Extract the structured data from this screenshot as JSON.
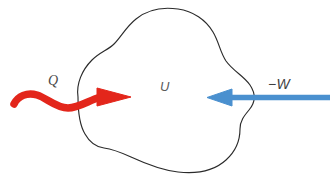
{
  "figure": {
    "background_color": "#ffffff"
  },
  "system": {
    "name": "system-boundary-blob",
    "outline_color": "#2b2b2b",
    "fill_color": "#ffffff",
    "internal_energy_label": "U"
  },
  "flows": [
    {
      "id": "heat-in",
      "label": "Q",
      "color": "#e3261b",
      "direction": "into-system",
      "style": "wavy",
      "meaning": "heat added to system"
    },
    {
      "id": "work-in",
      "label": "−W",
      "color": "#4a90cf",
      "direction": "into-system",
      "style": "straight",
      "meaning": "negative work, i.e. work done on system"
    }
  ],
  "labels": {
    "heat": "Q",
    "internal_energy": "U",
    "work": "−W"
  },
  "colors": {
    "heat_red": "#e3261b",
    "work_blue": "#4a90cf",
    "outline_black": "#2b2b2b",
    "text_gray": "#4a4a4a",
    "background": "#ffffff"
  }
}
